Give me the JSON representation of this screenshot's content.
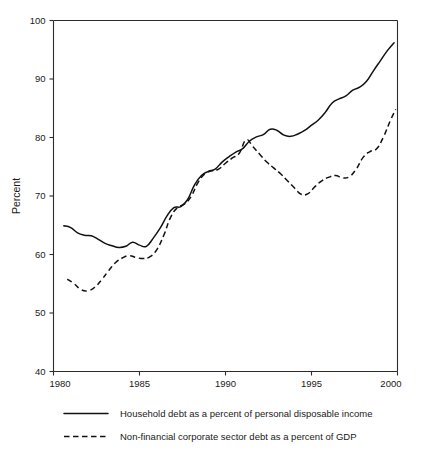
{
  "chart_data": {
    "type": "line",
    "title": "",
    "xlabel": "",
    "ylabel": "Percent",
    "xlim": [
      1980,
      2000
    ],
    "ylim": [
      40,
      100
    ],
    "xticks": [
      1980,
      1985,
      1990,
      1995,
      2000
    ],
    "yticks": [
      40,
      50,
      60,
      70,
      80,
      90,
      100
    ],
    "xtick_labels": [
      "1980",
      "1985",
      "1990",
      "1995",
      "2000"
    ],
    "ytick_labels": [
      "40",
      "50",
      "60",
      "70",
      "80",
      "90",
      "100"
    ],
    "grid": false,
    "legend_position": "below",
    "series": [
      {
        "name": "Household debt as a percent of personal disposable income",
        "style": "solid",
        "color": "#111111",
        "x": [
          1980.6,
          1981.0,
          1981.4,
          1981.8,
          1982.2,
          1982.6,
          1983.0,
          1983.4,
          1983.8,
          1984.2,
          1984.6,
          1985.0,
          1985.4,
          1985.8,
          1986.2,
          1986.6,
          1987.0,
          1987.4,
          1987.8,
          1988.2,
          1988.6,
          1989.0,
          1989.4,
          1989.8,
          1990.2,
          1990.6,
          1991.0,
          1991.4,
          1991.8,
          1992.2,
          1992.6,
          1993.0,
          1993.4,
          1993.8,
          1994.2,
          1994.6,
          1995.0,
          1995.4,
          1995.8,
          1996.2,
          1996.6,
          1997.0,
          1997.4,
          1997.8,
          1998.2,
          1998.6,
          1999.0,
          1999.4,
          1999.8
        ],
        "y": [
          64.9,
          64.6,
          63.7,
          63.3,
          63.2,
          62.6,
          61.9,
          61.5,
          61.2,
          61.4,
          62.1,
          61.6,
          61.4,
          62.8,
          64.5,
          66.6,
          68.0,
          68.2,
          69.4,
          71.9,
          73.5,
          74.2,
          74.6,
          75.8,
          76.7,
          77.5,
          78.1,
          79.4,
          80.1,
          80.5,
          81.4,
          81.2,
          80.4,
          80.2,
          80.6,
          81.2,
          82.1,
          83.0,
          84.3,
          85.9,
          86.6,
          87.1,
          88.1,
          88.6,
          89.6,
          91.4,
          93.1,
          94.8,
          96.2
        ]
      },
      {
        "name": "Non-financial corporate sector debt as a percent of GDP",
        "style": "dashed",
        "color": "#111111",
        "x": [
          1980.8,
          1981.2,
          1981.6,
          1982.0,
          1982.4,
          1982.8,
          1983.2,
          1983.6,
          1984.0,
          1984.4,
          1984.8,
          1985.2,
          1985.6,
          1986.0,
          1986.4,
          1986.8,
          1987.2,
          1987.6,
          1988.0,
          1988.4,
          1988.8,
          1989.2,
          1989.6,
          1990.0,
          1990.4,
          1990.8,
          1991.2,
          1991.6,
          1992.0,
          1992.4,
          1992.8,
          1993.2,
          1993.6,
          1994.0,
          1994.4,
          1994.8,
          1995.2,
          1995.6,
          1996.0,
          1996.4,
          1996.8,
          1997.2,
          1997.6,
          1998.0,
          1998.4,
          1998.8,
          1999.2,
          1999.6,
          1999.9
        ],
        "y": [
          55.8,
          55.0,
          54.0,
          53.8,
          54.4,
          55.7,
          57.2,
          58.6,
          59.4,
          59.8,
          59.5,
          59.3,
          59.6,
          60.8,
          63.2,
          66.3,
          68.0,
          68.6,
          69.9,
          72.3,
          73.8,
          74.3,
          74.6,
          75.6,
          76.5,
          77.3,
          79.6,
          78.4,
          77.1,
          75.8,
          74.8,
          73.8,
          72.6,
          71.4,
          70.3,
          70.4,
          71.6,
          72.6,
          73.2,
          73.5,
          73.1,
          73.3,
          74.6,
          76.6,
          77.6,
          78.1,
          80.2,
          83.0,
          84.8
        ]
      }
    ]
  },
  "legend": {
    "items": [
      {
        "label": "Household debt as a percent of personal disposable income",
        "style": "solid"
      },
      {
        "label": "Non-financial corporate sector debt as a percent of GDP",
        "style": "dashed"
      }
    ]
  }
}
